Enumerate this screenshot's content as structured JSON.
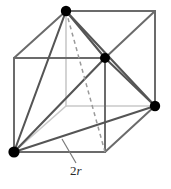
{
  "figure": {
    "label_2r": "2",
    "label_2r_symbol": "r",
    "colors": {
      "edge_visible": "#6b6b6b",
      "edge_hidden": "#c9c9c9",
      "tetrahedron": "#555555",
      "dashed": "#9a9a9a",
      "atom": "#000000",
      "leader": "#7a7a7a",
      "background": "#ffffff"
    },
    "atoms": [
      {
        "name": "atom-top-back-left",
        "x": 66,
        "y": 11,
        "r": 5.2
      },
      {
        "name": "atom-face-center",
        "x": 105,
        "y": 58,
        "r": 5.0
      },
      {
        "name": "atom-right",
        "x": 155,
        "y": 106,
        "r": 5.2
      },
      {
        "name": "atom-bottom-front-left",
        "x": 14,
        "y": 152,
        "r": 5.6
      }
    ],
    "cube": {
      "front": [
        {
          "x": 14,
          "y": 58
        },
        {
          "x": 105,
          "y": 58
        },
        {
          "x": 105,
          "y": 152
        },
        {
          "x": 14,
          "y": 152
        }
      ],
      "back": [
        {
          "x": 66,
          "y": 11
        },
        {
          "x": 155,
          "y": 11
        },
        {
          "x": 155,
          "y": 106
        },
        {
          "x": 66,
          "y": 106
        }
      ]
    },
    "hidden_edges": [
      {
        "name": "hidden-edge-back-bottom-left",
        "x1": 14,
        "y1": 152,
        "x2": 66,
        "y2": 106
      },
      {
        "name": "hidden-edge-back-bottom-horizontal",
        "x1": 66,
        "y1": 106,
        "x2": 155,
        "y2": 106
      },
      {
        "name": "hidden-edge-back-vertical",
        "x1": 66,
        "y1": 11,
        "x2": 66,
        "y2": 106
      }
    ],
    "visible_edges": [
      {
        "name": "edge-front-top",
        "x1": 14,
        "y1": 58,
        "x2": 105,
        "y2": 58
      },
      {
        "name": "edge-front-left",
        "x1": 14,
        "y1": 58,
        "x2": 14,
        "y2": 152
      },
      {
        "name": "edge-front-bottom",
        "x1": 14,
        "y1": 152,
        "x2": 105,
        "y2": 152
      },
      {
        "name": "edge-front-right",
        "x1": 105,
        "y1": 58,
        "x2": 105,
        "y2": 152
      },
      {
        "name": "edge-back-top",
        "x1": 66,
        "y1": 11,
        "x2": 155,
        "y2": 11
      },
      {
        "name": "edge-back-right",
        "x1": 155,
        "y1": 11,
        "x2": 155,
        "y2": 106
      },
      {
        "name": "edge-top-left-diagonal",
        "x1": 14,
        "y1": 58,
        "x2": 66,
        "y2": 11
      },
      {
        "name": "edge-top-right-diagonal",
        "x1": 105,
        "y1": 58,
        "x2": 155,
        "y2": 11
      },
      {
        "name": "edge-bottom-right-diagonal",
        "x1": 105,
        "y1": 152,
        "x2": 155,
        "y2": 106
      }
    ],
    "tetrahedron_edges": [
      {
        "name": "tet-edge-top-to-facecenter",
        "x1": 66,
        "y1": 11,
        "x2": 105,
        "y2": 58
      },
      {
        "name": "tet-edge-top-to-right",
        "x1": 66,
        "y1": 11,
        "x2": 155,
        "y2": 106
      },
      {
        "name": "tet-edge-top-to-bottomleft",
        "x1": 66,
        "y1": 11,
        "x2": 14,
        "y2": 152
      },
      {
        "name": "tet-edge-facecenter-to-right",
        "x1": 105,
        "y1": 58,
        "x2": 155,
        "y2": 106
      },
      {
        "name": "tet-edge-facecenter-to-bottomleft",
        "x1": 105,
        "y1": 58,
        "x2": 14,
        "y2": 152
      },
      {
        "name": "tet-edge-right-to-bottomleft",
        "x1": 155,
        "y1": 106,
        "x2": 14,
        "y2": 152
      }
    ],
    "dashed_line": {
      "name": "dashed-edge",
      "x1": 66,
      "y1": 11,
      "x2": 105,
      "y2": 152
    },
    "leader_line": {
      "name": "leader-line-2r",
      "x1": 62,
      "y1": 139,
      "x2": 76,
      "y2": 163
    }
  }
}
